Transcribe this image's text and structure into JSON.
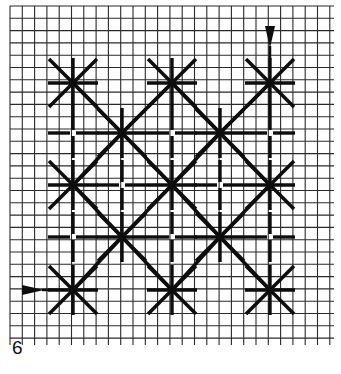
{
  "figure": {
    "number_label": "6",
    "colors": {
      "paper": "#ffffff",
      "grid": "#2a2a2a",
      "stitch": "#0d0d0d"
    }
  },
  "grid": {
    "x0": 10,
    "y0": 6,
    "x1": 334,
    "y1": 345,
    "spacing": 12.3
  },
  "stars": [
    {
      "x": 73,
      "y": 83
    },
    {
      "x": 172,
      "y": 83
    },
    {
      "x": 270,
      "y": 83
    },
    {
      "x": 122,
      "y": 133
    },
    {
      "x": 220,
      "y": 133
    },
    {
      "x": 73,
      "y": 185
    },
    {
      "x": 172,
      "y": 185
    },
    {
      "x": 270,
      "y": 185
    },
    {
      "x": 122,
      "y": 237
    },
    {
      "x": 220,
      "y": 237
    },
    {
      "x": 73,
      "y": 290
    },
    {
      "x": 172,
      "y": 290
    },
    {
      "x": 270,
      "y": 290
    }
  ],
  "crosses": [
    {
      "x": 73,
      "y": 133
    },
    {
      "x": 172,
      "y": 133
    },
    {
      "x": 270,
      "y": 133
    },
    {
      "x": 122,
      "y": 185
    },
    {
      "x": 220,
      "y": 185
    },
    {
      "x": 73,
      "y": 237
    },
    {
      "x": 172,
      "y": 237
    },
    {
      "x": 270,
      "y": 237
    }
  ],
  "arrows": [
    {
      "name": "start-arrow-top",
      "direction": "down",
      "x": 270,
      "y": 48
    },
    {
      "name": "start-arrow-left",
      "direction": "right",
      "x": 46,
      "y": 290
    }
  ]
}
